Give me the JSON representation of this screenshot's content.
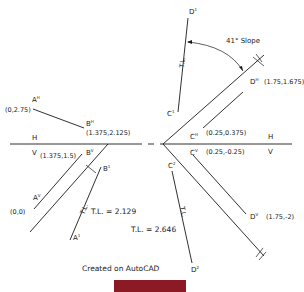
{
  "drawing": {
    "left": {
      "points": {
        "A_h": "A",
        "A_h_sup": "H",
        "A_h_coord": "(0,2.75)",
        "B_h": "B",
        "B_h_sup": "H",
        "B_h_coord": "(1.375,2.125)",
        "A_v": "A",
        "A_v_sup": "V",
        "A_v_coord": "(0,0)",
        "B_v": "B",
        "B_v_sup": "V",
        "B_v_coord": "(1.375,1.5)",
        "A_1": "A",
        "A_1_sup": "1",
        "B_1": "B",
        "B_1_sup": "1"
      },
      "fold_label_top": "H",
      "fold_label_bottom": "V",
      "tl_tag": "T.L.",
      "tl_value": "T.L. = 2.129"
    },
    "right": {
      "points": {
        "C_h": "C",
        "C_h_sup": "H",
        "C_h_coord": "(0.25,0.375)",
        "D_h": "D",
        "D_h_sup": "H",
        "D_h_coord": "(1.75,1.675)",
        "C_v": "C",
        "C_v_sup": "V",
        "C_v_coord": "(0.25,-0.25)",
        "D_v": "D",
        "D_v_sup": "V",
        "D_v_coord": "(1.75,-2)",
        "C_1": "C",
        "C_1_sup": "1",
        "D_1": "D",
        "D_1_sup": "1",
        "C_2": "C",
        "C_2_sup": "2",
        "D_2": "D",
        "D_2_sup": "2"
      },
      "fold_label_top": "H",
      "fold_label_bottom": "V",
      "fold_tag_h": "H",
      "fold_tag_1": "1",
      "tl_tag_upper": "T.L.",
      "tl_tag_lower": "T.L.",
      "tl_value": "T.L. = 2.646",
      "slope_label": "41° Slope"
    },
    "footer": "Created on AutoCAD"
  },
  "colors": {
    "ink": "#1a1a1a",
    "caption_bar": "#8b1a24",
    "background": "#ffffff"
  }
}
